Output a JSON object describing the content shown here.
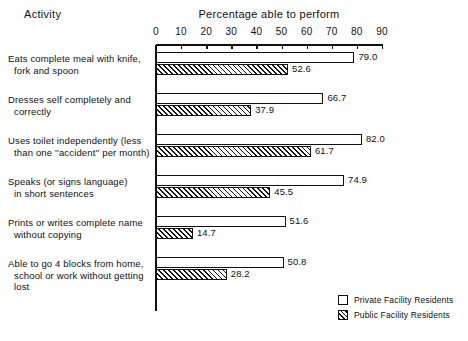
{
  "header": {
    "activity_label": "Activity",
    "title": "Percentage able to perform"
  },
  "axis": {
    "ticks": [
      0,
      10,
      20,
      30,
      40,
      50,
      60,
      70,
      80,
      90
    ],
    "min": 0,
    "max": 90
  },
  "legend": {
    "items": [
      {
        "label": "Private Facility Residents",
        "pattern": "solid-white"
      },
      {
        "label": "Public Facility Residents",
        "pattern": "diagonal-hatch"
      }
    ]
  },
  "chart_data": {
    "type": "bar",
    "orientation": "horizontal",
    "title": "Percentage able to perform",
    "xlabel": "Percentage able to perform",
    "ylabel": "Activity",
    "xlim": [
      0,
      90
    ],
    "grid": false,
    "legend_position": "bottom-right",
    "categories": [
      "Eats complete meal with knife, fork and spoon",
      "Dresses self completely and correctly",
      "Uses toilet independently (less than one \"accident\" per month)",
      "Speaks (or signs language) in short sentences",
      "Prints or writes complete name without copying",
      "Able to go 4 blocks from home, school or work without getting lost"
    ],
    "category_lines": [
      [
        "Eats complete meal with knife,",
        "fork and spoon"
      ],
      [
        "Dresses self completely and",
        "correctly"
      ],
      [
        "Uses toilet independently (less",
        "than one ''accident'' per month)"
      ],
      [
        "Speaks (or signs language)",
        "in short sentences"
      ],
      [
        "Prints or writes complete name",
        "without copying"
      ],
      [
        "Able to go 4 blocks from home,",
        "school or work without getting lost"
      ]
    ],
    "series": [
      {
        "name": "Private Facility Residents",
        "values": [
          79.0,
          66.7,
          82.0,
          74.9,
          51.6,
          50.8
        ],
        "labels": [
          "79.0",
          "66.7",
          "82.0",
          "74.9",
          "51.6",
          "50.8"
        ]
      },
      {
        "name": "Public Facility Residents",
        "values": [
          52.6,
          37.9,
          61.7,
          45.5,
          14.7,
          28.2
        ],
        "labels": [
          "52.6",
          "37.9",
          "61.7",
          "45.5",
          "14.7",
          "28.2"
        ]
      }
    ]
  },
  "colors": {
    "ink": "#111111",
    "background": "#ffffff"
  }
}
